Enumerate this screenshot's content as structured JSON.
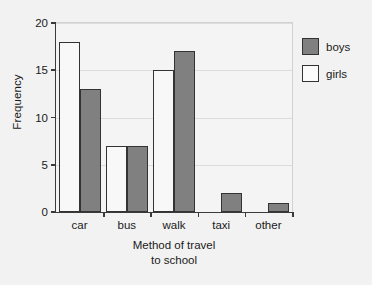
{
  "chart_data": {
    "type": "bar",
    "title": "",
    "subtitle": "",
    "categories": [
      "car",
      "bus",
      "walk",
      "taxi",
      "other"
    ],
    "series": [
      {
        "name": "girls",
        "values": [
          18,
          7,
          15,
          0,
          0
        ],
        "color": "#f8f8f8"
      },
      {
        "name": "boys",
        "values": [
          13,
          7,
          17,
          2,
          1
        ],
        "color": "#808080"
      }
    ],
    "series_draw_order": [
      "girls",
      "boys"
    ],
    "xlabel": "Method of travel to school",
    "xlabel_lines": [
      "Method of travel",
      "to school"
    ],
    "ylabel": "Frequency",
    "ylim": [
      0,
      20
    ],
    "ytick_values": [
      0,
      5,
      10,
      15,
      20
    ],
    "ytick_labels": [
      "0",
      "5",
      "10",
      "15",
      "20"
    ],
    "ytick_interval": 5,
    "grid": true,
    "grid_axis": "y",
    "legend_position": "top-right-outside",
    "legend_entries": [
      {
        "label": "boys",
        "color": "#808080"
      },
      {
        "label": "girls",
        "color": "#f8f8f8"
      }
    ]
  },
  "colors": {
    "background": "#f2f2f2",
    "plot_background": "#f4f4f4",
    "axis": "#3a3a3a",
    "grid": "#dcdcdc",
    "bar_border": "#333333",
    "boys_fill": "#808080",
    "girls_fill": "#f8f8f8",
    "text": "#1a1a1a"
  }
}
